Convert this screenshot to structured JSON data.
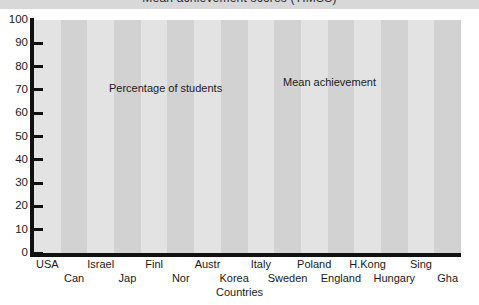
{
  "title": {
    "text": "Mean achievement scores (TIMSS)",
    "clipped": true
  },
  "axis": {
    "x_title": "Countries",
    "y_ticks": [
      "100",
      "90",
      "80",
      "70",
      "60",
      "50",
      "40",
      "30",
      "20",
      "10",
      "0"
    ]
  },
  "annotations": {
    "series_a": "Percentage of students",
    "series_b": "Mean achievement"
  },
  "colors": {
    "series_a": "#8a8a8a",
    "series_b": "#b6b6b6",
    "plot_bg": "#dcdcdc",
    "band_light": "#e3e3e3",
    "band_dark": "#d2d2d2",
    "axis": "#111111",
    "title_strip": "#d8d8d8"
  },
  "chart_data": {
    "type": "line",
    "title": "Mean achievement scores (TIMSS)",
    "xlabel": "Countries",
    "ylabel": "",
    "ylim": [
      0,
      100
    ],
    "ytick_step": 10,
    "grid": false,
    "legend": "inline-annotations",
    "categories": [
      "USA",
      "Can",
      "Israel",
      "Jap",
      "Finl",
      "Nor",
      "Austr",
      "Korea",
      "Italy",
      "Sweden",
      "Poland",
      "England",
      "H.Kong",
      "Hungary",
      "Sing",
      "Gha"
    ],
    "series": [
      {
        "name": "Percentage of students",
        "color": "#8a8a8a",
        "values": [
          84,
          65,
          61,
          58,
          41,
          44,
          43,
          40,
          38,
          35,
          29,
          28,
          22,
          21,
          18,
          0
        ]
      },
      {
        "name": "Mean achievement",
        "color": "#b6b6b6",
        "values": [
          39,
          41,
          46,
          43,
          40,
          51,
          42,
          31,
          39,
          41,
          46,
          70,
          81,
          50,
          68,
          60
        ]
      }
    ]
  }
}
